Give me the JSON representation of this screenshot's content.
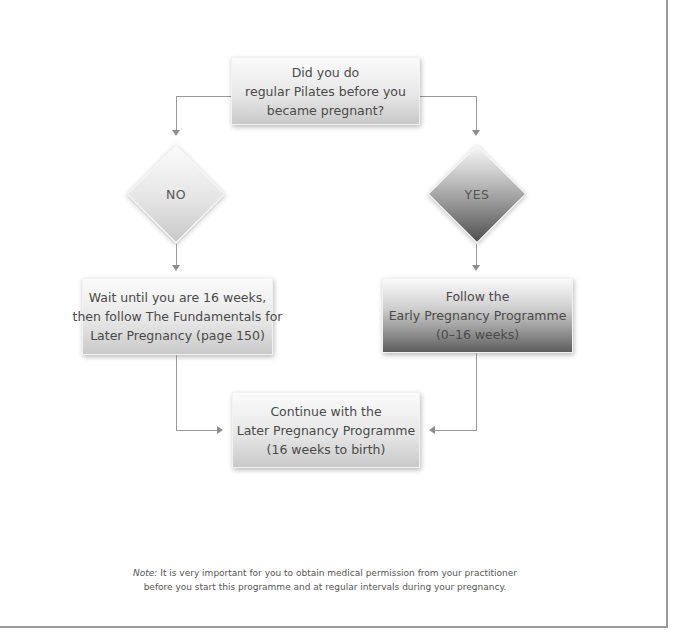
{
  "flowchart": {
    "question": {
      "lines": [
        "Did you do",
        "regular Pilates before you",
        "became pregnant?"
      ]
    },
    "branch_no": {
      "label": "NO"
    },
    "branch_yes": {
      "label": "YES"
    },
    "no_outcome": {
      "lines": [
        "Wait until you are 16 weeks,",
        "then follow The Fundamentals for",
        "Later Pregnancy (page 150)"
      ]
    },
    "yes_outcome": {
      "lines": [
        "Follow the",
        "Early Pregnancy Programme",
        "(0–16 weeks)"
      ]
    },
    "final_step": {
      "lines": [
        "Continue with the",
        "Later Pregnancy Programme",
        "(16 weeks to birth)"
      ]
    }
  },
  "note": {
    "prefix": "Note:",
    "line1": " It is very important for you to obtain medical permission from your practitioner",
    "line2": "before you start this programme and at regular intervals during your pregnancy."
  },
  "colors": {
    "connector": "#999999",
    "frame": "#9a9a9a",
    "text": "#4a4a4a"
  }
}
